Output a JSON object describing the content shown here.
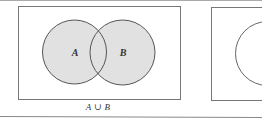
{
  "figure": {
    "type": "venn-diagram",
    "panels": [
      {
        "id": "union",
        "caption": "A ∪ B",
        "sets": [
          {
            "label": "A",
            "shaded": true
          },
          {
            "label": "B",
            "shaded": true
          }
        ],
        "shading": "A union B"
      },
      {
        "id": "partial",
        "caption": "",
        "sets": [
          {
            "label": "",
            "shaded": false
          }
        ]
      }
    ],
    "colors": {
      "fill": "#e1e1e1",
      "stroke": "#555555",
      "frame": "#777777",
      "rule": "#888888"
    }
  }
}
